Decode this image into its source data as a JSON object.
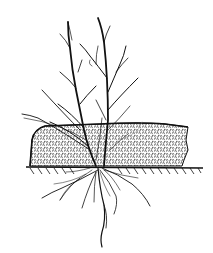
{
  "illustration": {
    "subject": "shrub-planted-in-mulch-layer",
    "style": "black ink line drawing",
    "colors": {
      "background": "#ffffff",
      "ink": "#111111",
      "stipple": "#222222"
    },
    "parts": [
      "branches",
      "mulch-layer",
      "ground-line",
      "roots"
    ]
  }
}
